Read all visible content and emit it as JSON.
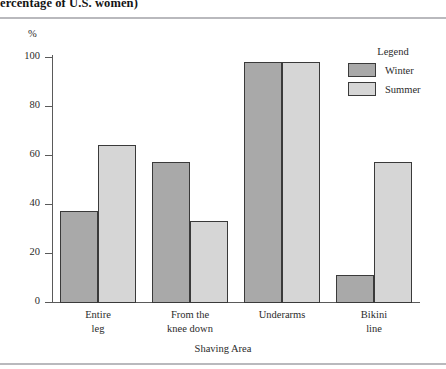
{
  "figure": {
    "title": "ercentage of U.S. women)"
  },
  "chart_data": {
    "type": "bar",
    "title": "ercentage of U.S. women)",
    "xlabel": "Shaving Area",
    "ylabel": "%",
    "ylim": [
      0,
      100
    ],
    "yticks": [
      0,
      20,
      40,
      60,
      80,
      100
    ],
    "grid": false,
    "legend_position": "top-right",
    "legend_title": "Legend",
    "categories": [
      "Entire leg",
      "From the knee down",
      "Underarms",
      "Bikini line"
    ],
    "category_lines": [
      [
        "Entire",
        "leg"
      ],
      [
        "From the",
        "knee down"
      ],
      [
        "Underarms",
        ""
      ],
      [
        "Bikini",
        "line"
      ]
    ],
    "series": [
      {
        "name": "Winter",
        "color": "#a9a9a9",
        "values": [
          37,
          57,
          98,
          11
        ]
      },
      {
        "name": "Summer",
        "color": "#d6d6d6",
        "values": [
          64,
          33,
          98,
          57
        ]
      }
    ]
  },
  "colors": {
    "winter": "#a9a9a9",
    "summer": "#d6d6d6",
    "bar_outline": "#3a3a3a",
    "axis": "#5a5a5a",
    "rule": "#b9b9bd"
  }
}
